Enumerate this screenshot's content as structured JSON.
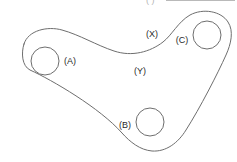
{
  "figure": {
    "kind": "technical-line-drawing",
    "background_color": "#ffffff",
    "line_color": "#6e6e6e",
    "label_color": "#2a2a2a",
    "width": 237,
    "height": 162
  },
  "header": {
    "code": "( )",
    "visible": true,
    "note_clipped": true
  },
  "callouts": [
    {
      "id": "A",
      "label": "(A)",
      "x": 70,
      "y": 62,
      "refers_to": "left hole"
    },
    {
      "id": "B",
      "label": "(B)",
      "x": 125,
      "y": 126,
      "refers_to": "bottom hole"
    },
    {
      "id": "C",
      "label": "(C)",
      "x": 182,
      "y": 41,
      "refers_to": "right hole"
    },
    {
      "id": "X",
      "label": "(X)",
      "x": 152,
      "y": 35,
      "refers_to": "upper concave edge"
    },
    {
      "id": "Y",
      "label": "(Y)",
      "x": 140,
      "y": 72,
      "refers_to": "plate body face"
    }
  ],
  "holes": [
    {
      "id": "A",
      "cx": 45,
      "cy": 61,
      "r": 14
    },
    {
      "id": "B",
      "cx": 150,
      "cy": 122,
      "r": 14
    },
    {
      "id": "C",
      "cx": 207,
      "cy": 35,
      "r": 14
    }
  ],
  "outline": {
    "path": "M 24 44 C 28 30, 48 26, 62 30 C 80 35, 96 45, 114 51 C 132 57, 150 52, 163 42 C 172 35, 178 22, 190 15 C 203 8, 221 11, 228 22 C 234 31, 231 44, 226 55 C 218 73, 200 108, 186 130 C 178 143, 166 152, 152 151 C 140 150, 130 142, 122 133 C 100 108, 52 80, 30 70 C 22 66, 21 53, 24 44 Z"
  }
}
